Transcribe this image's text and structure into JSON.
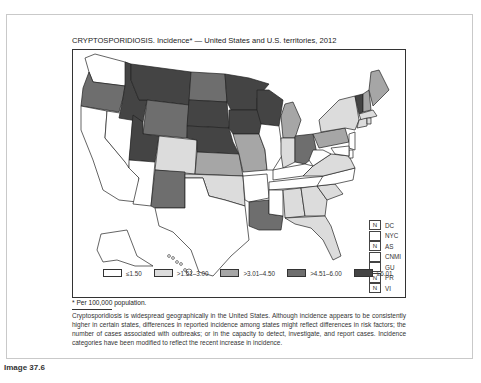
{
  "title": "CRYPTOSPORIDIOSIS. Incidence* — United States and U.S. territories, 2012",
  "footnote": "* Per 100,000 population.",
  "description": "Cryptosporidiosis is widespread geographically in the United States. Although incidence appears to be consistently higher in certain states, differences in reported incidence among states might reflect differences in risk factors; the number of cases associated with outbreaks; or in the capacity to detect, investigate, and report cases. Incidence categories have been modified to reflect the recent increase in incidence.",
  "caption": "Image 37.6",
  "territories": [
    {
      "code": "DC",
      "mark": "N"
    },
    {
      "code": "NYC",
      "mark": ""
    },
    {
      "code": "AS",
      "mark": "N"
    },
    {
      "code": "CNMI",
      "mark": ""
    },
    {
      "code": "GU",
      "mark": ""
    },
    {
      "code": "PR",
      "mark": "N"
    },
    {
      "code": "VI",
      "mark": "N"
    }
  ],
  "chart_data": {
    "type": "heatmap",
    "subtype": "choropleth",
    "title": "CRYPTOSPORIDIOSIS. Incidence* — United States and U.S. territories, 2012",
    "unit": "per 100,000 population",
    "legend_position": "bottom",
    "categories": [
      {
        "label": "≤1.50",
        "color": "#ffffff"
      },
      {
        "label": ">1.51–3.00",
        "color": "#dcdcdc"
      },
      {
        "label": ">3.01–4.50",
        "color": "#a6a6a6"
      },
      {
        "label": ">4.51–6.00",
        "color": "#6e6e6e"
      },
      {
        "label": "≥6.01",
        "color": "#444444"
      }
    ],
    "states": {
      "WA": 0,
      "OR": 3,
      "CA": 0,
      "NV": 0,
      "ID": 4,
      "MT": 4,
      "WY": 3,
      "UT": 4,
      "CO": 1,
      "AZ": 0,
      "NM": 3,
      "ND": 3,
      "SD": 4,
      "NE": 4,
      "KS": 2,
      "OK": 1,
      "TX": 0,
      "MN": 4,
      "IA": 4,
      "MO": 2,
      "AR": 0,
      "LA": 3,
      "WI": 4,
      "IL": 0,
      "MI": 2,
      "IN": 1,
      "OH": 3,
      "KY": 0,
      "TN": 0,
      "MS": 0,
      "AL": 1,
      "GA": 1,
      "FL": 1,
      "SC": 1,
      "NC": 0,
      "VA": 1,
      "WV": 0,
      "PA": 2,
      "NY": 1,
      "VT": 4,
      "NH": 2,
      "ME": 2,
      "MA": 1,
      "CT": 1,
      "RI": 1,
      "NJ": 0,
      "DE": 0,
      "MD": 0,
      "AK": 0,
      "HI": 0
    },
    "territories": {
      "DC": "N",
      "NYC": "",
      "AS": "N",
      "CNMI": "",
      "GU": "",
      "PR": "N",
      "VI": "N"
    }
  }
}
